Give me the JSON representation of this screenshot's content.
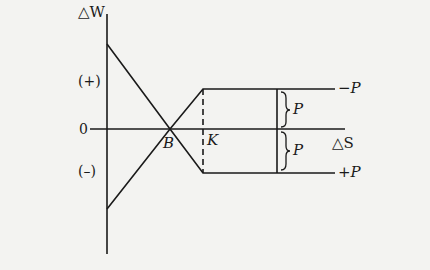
{
  "diagram": {
    "y_axis_label": "△W",
    "x_axis_label": "△S",
    "origin_label": "0",
    "positive_region_label": "(+)",
    "negative_region_label": "(–)",
    "point_b_label": "B",
    "point_k_label": "K",
    "upper_line_label": "−P",
    "lower_line_label": "+P",
    "upper_brace_label": "P",
    "lower_brace_label": "P"
  }
}
